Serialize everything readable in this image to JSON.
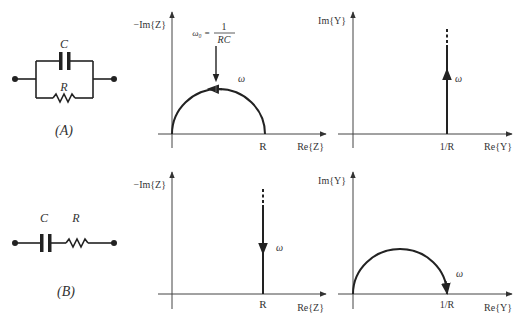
{
  "colors": {
    "line": "#222222",
    "axis": "#333333",
    "background": "#ffffff"
  },
  "circuits": [
    {
      "id": "A",
      "caption": "(A)",
      "capacitor_label": "C",
      "resistor_label": "R",
      "topology": "parallel RC"
    },
    {
      "id": "B",
      "caption": "(B)",
      "capacitor_label": "C",
      "resistor_label": "R",
      "topology": "series RC"
    }
  ],
  "plots": {
    "a_impedance": {
      "y_label": "−Im{Z}",
      "x_label": "Re{Z}",
      "tick_label": "R",
      "omega_label": "ω",
      "annotation": {
        "lhs": "ω₀ =",
        "numerator": "1",
        "denominator": "RC"
      },
      "shape": "semicircle"
    },
    "a_admittance": {
      "y_label": "Im{Y}",
      "x_label": "Re{Y}",
      "tick_label": "1/R",
      "omega_label": "ω",
      "shape": "vertical line upward"
    },
    "b_impedance": {
      "y_label": "−Im{Z}",
      "x_label": "Re{Z}",
      "tick_label": "R",
      "omega_label": "ω",
      "shape": "vertical line downward"
    },
    "b_admittance": {
      "y_label": "Im{Y}",
      "x_label": "Re{Y}",
      "tick_label": "1/R",
      "omega_label": "ω",
      "shape": "semicircle"
    }
  }
}
